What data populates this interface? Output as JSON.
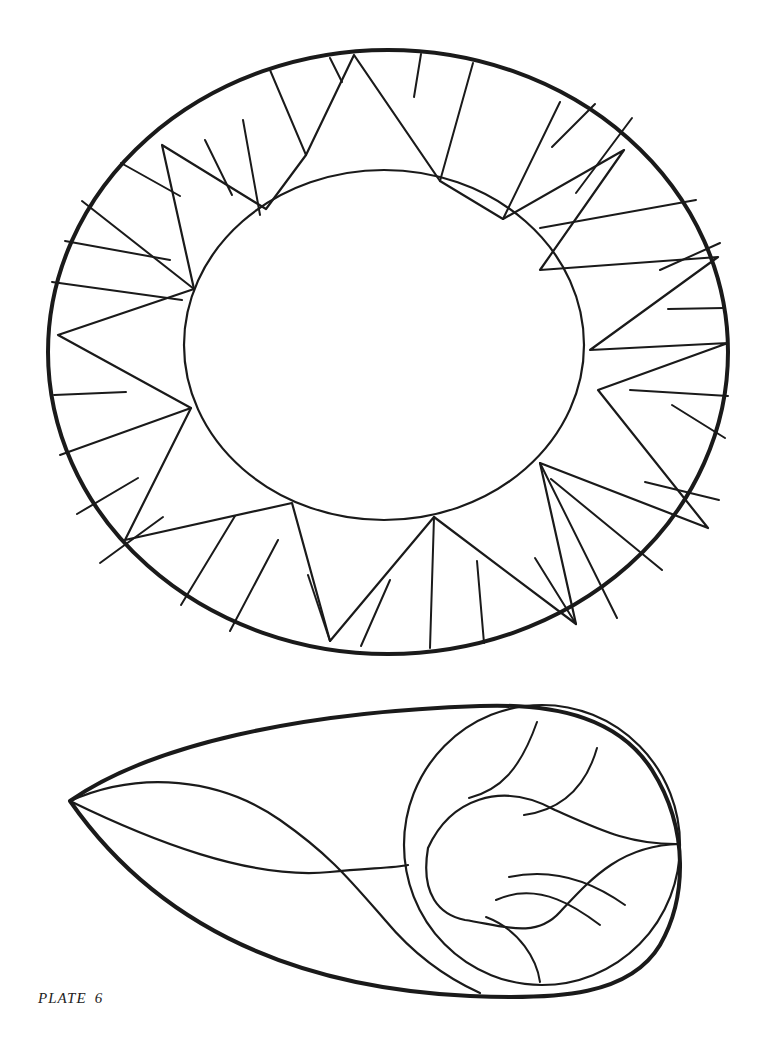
{
  "caption": {
    "label": "PLATE",
    "number": "6"
  },
  "colors": {
    "background": "#ffffff",
    "line": "#1a1a1a"
  },
  "figures": [
    {
      "name": "oval-sunburst",
      "description": "Oval with inner oval and ring of triangular segments"
    },
    {
      "name": "teardrop-leaf",
      "description": "Teardrop shape with inner circle and leaf segments"
    }
  ]
}
